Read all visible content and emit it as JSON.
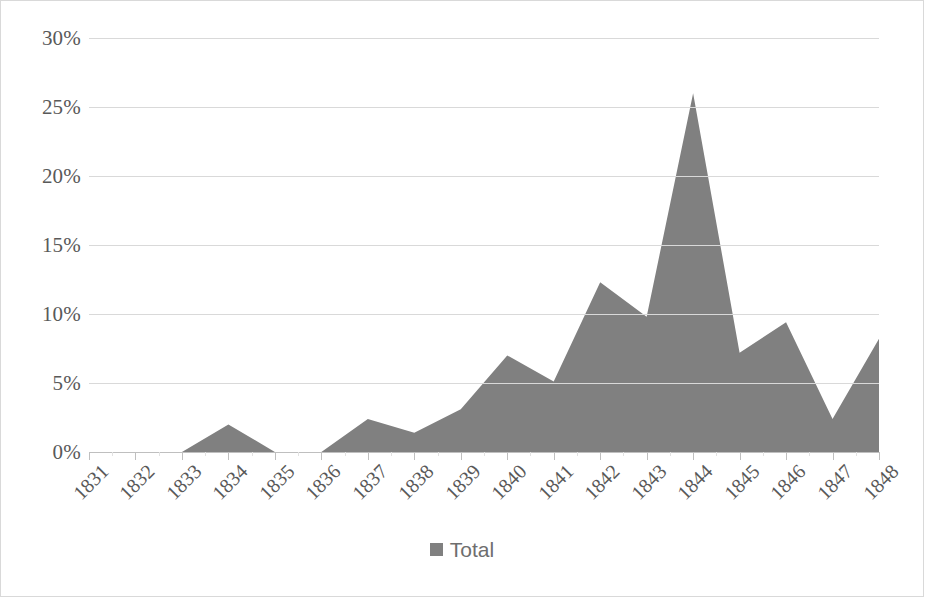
{
  "chart_data": {
    "type": "area",
    "title": "",
    "subtitle": "",
    "xlabel": "",
    "ylabel": "",
    "categories": [
      "1831",
      "1832",
      "1833",
      "1834",
      "1835",
      "1836",
      "1837",
      "1838",
      "1839",
      "1840",
      "1841",
      "1842",
      "1843",
      "1844",
      "1845",
      "1846",
      "1847",
      "1848"
    ],
    "series": [
      {
        "name": "Total",
        "color": "#808080",
        "values": [
          0,
          0,
          0,
          2.0,
          0,
          0,
          2.4,
          1.4,
          3.1,
          7.0,
          5.1,
          12.3,
          9.8,
          26.0,
          7.2,
          9.4,
          2.4,
          8.2
        ]
      }
    ],
    "ylim": [
      0,
      30
    ],
    "ytick_values": [
      0,
      5,
      10,
      15,
      20,
      25,
      30
    ],
    "ytick_labels": [
      "0%",
      "5%",
      "10%",
      "15%",
      "20%",
      "25%",
      "30%"
    ],
    "grid": true,
    "grid_color": "#d9d9d9",
    "legend_position": "bottom",
    "y_axis_format": "percent",
    "x_tick_label_rotation": -45
  },
  "legend": {
    "items": [
      {
        "label": "Total",
        "marker": "square",
        "color": "#808080"
      }
    ]
  },
  "axes": {
    "y_labels": [
      "30%",
      "25%",
      "20%",
      "15%",
      "10%",
      "5%",
      "0%"
    ],
    "x_labels": [
      "1831",
      "1832",
      "1833",
      "1834",
      "1835",
      "1836",
      "1837",
      "1838",
      "1839",
      "1840",
      "1841",
      "1842",
      "1843",
      "1844",
      "1845",
      "1846",
      "1847",
      "1848"
    ]
  },
  "style": {
    "border_color": "#d9d9d9",
    "plot_background": "#ffffff",
    "axis_text_color": "#595959",
    "series_fill": "#808080"
  }
}
